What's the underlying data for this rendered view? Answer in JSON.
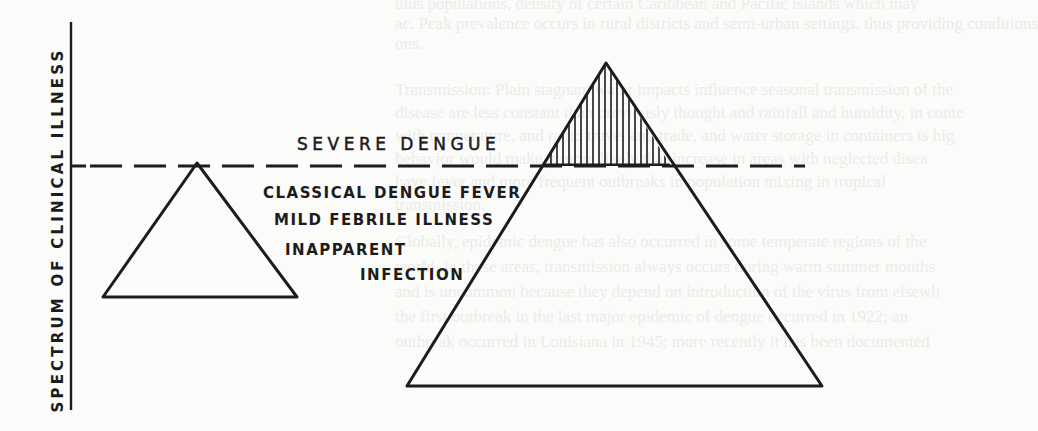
{
  "figure": {
    "axis_label": "SPECTRUM OF CLINICAL ILLNESS",
    "threshold_label": "SEVERE DENGUE",
    "levels": [
      {
        "label": "CLASSICAL DENGUE FEVER"
      },
      {
        "label": "MILD FEBRILE ILLNESS"
      },
      {
        "label": "INAPPARENT"
      },
      {
        "label": "INFECTION"
      }
    ],
    "triangles": [
      {
        "name": "left-triangle",
        "apex": [
          197,
          163
        ],
        "base_left": [
          103,
          297
        ],
        "base_right": [
          297,
          297
        ],
        "hatched_above_threshold": false
      },
      {
        "name": "right-triangle",
        "apex": [
          606,
          63
        ],
        "base_left": [
          407,
          386
        ],
        "base_right": [
          822,
          386
        ],
        "hatched_above_threshold": true
      }
    ],
    "threshold_y": 166,
    "colors": {
      "ink": "#1c1c1c",
      "paper": "#fbfbf9",
      "bleed_through": "#ececea"
    }
  },
  "bleed_through_text": [
    "ulus populations, density of certain Caribbean and Pacific islands which may",
    "ac. Peak prevalence occurs in rural districts and semi-urban settings, thus providing conditions",
    "ons.",
    "Transmission: Plain stagnant water impacts influence seasonal transmission of the",
    "disease are less constant than previously thought and rainfall and humidity, in conte",
    "with temperature, and rapid travel and trade, and water storage in containers is hig",
    "behavior would make it more likely that increase in areas with neglected disea",
    "have fever and more frequent outbreaks in population mixing in tropical",
    "transmission.",
    "Globally, epidemic dengue has also occurred in some temperate regions of the",
    "world. In these areas, transmission always occurs during warm summer months",
    "and is uncommon because they depend on introduction of the virus from elsewh",
    "the first outbreak in the last major epidemic of dengue occurred in 1922; an",
    "outbreak occurred in Louisiana in 1945; more recently it has been documented"
  ]
}
